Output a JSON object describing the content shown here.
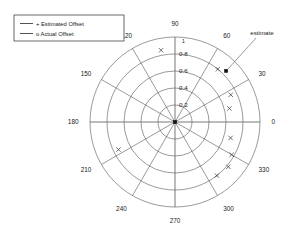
{
  "figure": {
    "width": 296,
    "height": 237,
    "background": "#ffffff",
    "ink_color": "#1a1a1a",
    "grid_color": "#555555"
  },
  "legend": {
    "position": "top-left",
    "entries": [
      {
        "marker": "+",
        "label": "+ Estimated Offset"
      },
      {
        "marker": "o",
        "label": "o Actual Offset"
      }
    ]
  },
  "annotations": [
    {
      "text": "estimate",
      "target_angle_deg": 45,
      "target_radius": 0.85
    }
  ],
  "chart_data": {
    "type": "scatter",
    "projection": "polar",
    "title": "",
    "xlabel": "",
    "ylabel": "",
    "grid": true,
    "legend_position": "top-left",
    "angular_axis": {
      "unit": "degrees",
      "direction": "counterclockwise",
      "zero_location": "E",
      "tick_labels": [
        "0",
        "30",
        "60",
        "90",
        "120",
        "150",
        "180",
        "210",
        "240",
        "270",
        "300",
        "330"
      ],
      "tick_values": [
        0,
        30,
        60,
        90,
        120,
        150,
        180,
        210,
        240,
        270,
        300,
        330
      ]
    },
    "radial_axis": {
      "rlim": [
        0,
        1
      ],
      "tick_labels": [
        "0.2",
        "0.4",
        "0.6",
        "0.8",
        "1"
      ],
      "tick_values": [
        0.2,
        0.4,
        0.6,
        0.8,
        1.0
      ],
      "label_angle_deg": 90
    },
    "series": [
      {
        "name": "+ Estimated Offset",
        "marker": "x",
        "color": "#333333",
        "points": [
          {
            "angle_deg": 101,
            "radius": 0.86
          },
          {
            "angle_deg": 51,
            "radius": 0.8
          },
          {
            "angle_deg": 26,
            "radius": 0.73
          },
          {
            "angle_deg": 14,
            "radius": 0.66
          },
          {
            "angle_deg": -16,
            "radius": 0.68
          },
          {
            "angle_deg": -30,
            "radius": 0.77
          },
          {
            "angle_deg": -40,
            "radius": 0.82
          },
          {
            "angle_deg": -52,
            "radius": 0.8
          },
          {
            "angle_deg": 206,
            "radius": 0.74
          }
        ]
      },
      {
        "name": "o Actual Offset",
        "marker": "square",
        "color": "#111111",
        "points": [
          {
            "angle_deg": 0,
            "radius": 0.0
          },
          {
            "angle_deg": 45,
            "radius": 0.85
          }
        ]
      }
    ]
  }
}
